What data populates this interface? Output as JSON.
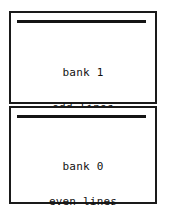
{
  "diagram": {
    "colors": {
      "border": "#1a1a1a",
      "rule": "#141414",
      "text": "#111111",
      "background": "#ffffff"
    },
    "banks": [
      {
        "id": "bank-upper",
        "name": "bank 1",
        "lines": "odd lines",
        "size": "8000 bytes"
      },
      {
        "id": "bank-lower",
        "name": "bank 0",
        "lines": "even lines",
        "size": "8000 bytes"
      }
    ]
  }
}
